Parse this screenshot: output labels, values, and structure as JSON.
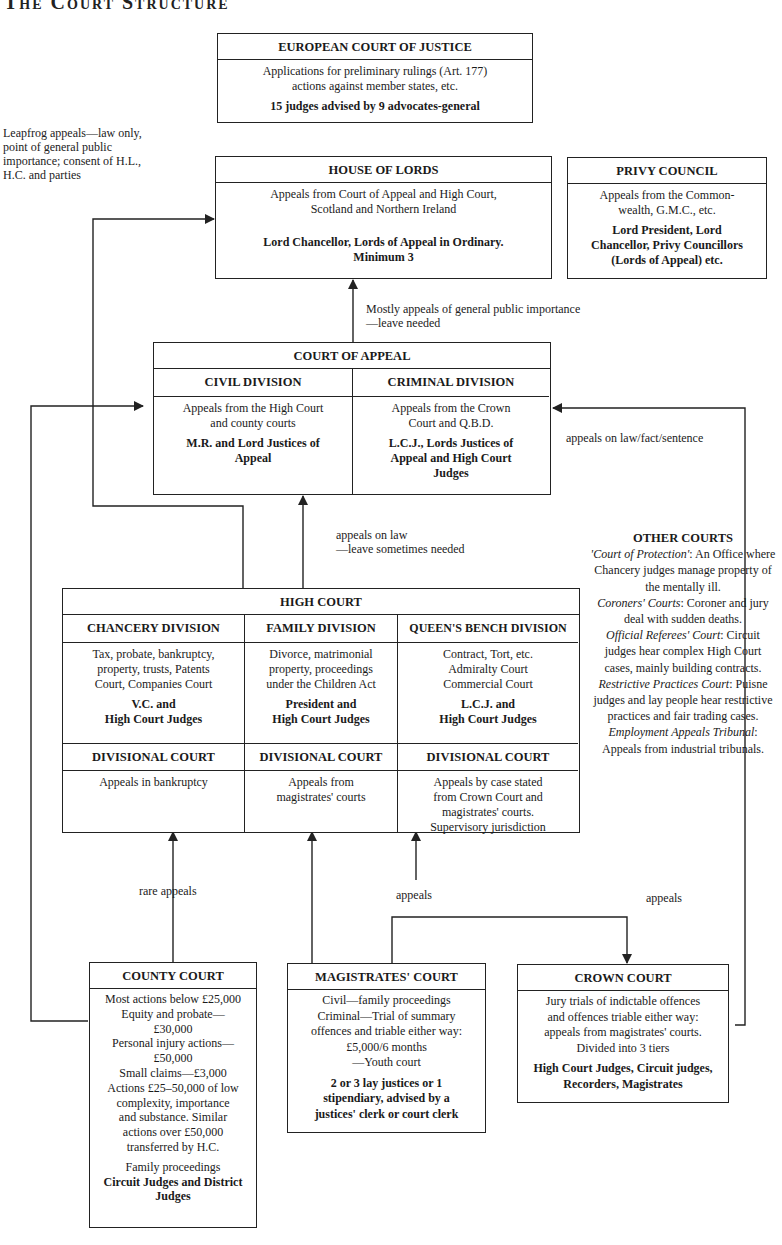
{
  "page": {
    "title": "The Court Structure"
  },
  "ecj": {
    "title": "EUROPEAN COURT OF JUSTICE",
    "line1": "Applications for preliminary rulings (Art. 177)",
    "line2": "actions against member states, etc.",
    "judges": "15 judges advised by 9 advocates-general"
  },
  "leapfrog": {
    "line1": "Leapfrog appeals—law only,",
    "line2": "point of general public",
    "line3": "importance; consent of H.L.,",
    "line4": "H.C. and parties"
  },
  "house_of_lords": {
    "title": "HOUSE OF LORDS",
    "line1": "Appeals from Court of Appeal and High Court,",
    "line2": "Scotland and Northern Ireland",
    "judges1": "Lord Chancellor, Lords of Appeal in Ordinary.",
    "judges2": "Minimum 3"
  },
  "privy_council": {
    "title": "PRIVY COUNCIL",
    "line1": "Appeals from the Common-",
    "line2": "wealth, G.M.C., etc.",
    "judges1": "Lord President, Lord",
    "judges2": "Chancellor, Privy Councillors",
    "judges3": "(Lords of Appeal) etc."
  },
  "hol_appeal_note": {
    "line1": "Mostly appeals of general public importance",
    "line2": "—leave needed"
  },
  "court_of_appeal": {
    "title": "COURT OF APPEAL",
    "civil": {
      "title": "CIVIL DIVISION",
      "line1": "Appeals from the High Court",
      "line2": "and county courts",
      "judges1": "M.R. and Lord Justices of",
      "judges2": "Appeal"
    },
    "criminal": {
      "title": "CRIMINAL DIVISION",
      "line1": "Appeals from the Crown",
      "line2": "Court and Q.B.D.",
      "judges1": "L.C.J., Lords Justices of",
      "judges2": "Appeal and High Court",
      "judges3": "Judges"
    }
  },
  "crown_to_ca_note": "appeals on law/fact/sentence",
  "hc_to_ca_note": {
    "line1": "appeals on law",
    "line2": "—leave sometimes needed"
  },
  "high_court": {
    "title": "HIGH COURT",
    "chancery": {
      "title": "CHANCERY DIVISION",
      "line1": "Tax, probate, bankruptcy,",
      "line2": "property, trusts, Patents",
      "line3": "Court, Companies Court",
      "judges1": "V.C. and",
      "judges2": "High Court Judges",
      "div_title": "DIVISIONAL COURT",
      "div_line1": "Appeals in bankruptcy"
    },
    "family": {
      "title": "FAMILY DIVISION",
      "line1": "Divorce, matrimonial",
      "line2": "property, proceedings",
      "line3": "under the Children Act",
      "judges1": "President and",
      "judges2": "High Court Judges",
      "div_title": "DIVISIONAL COURT",
      "div_line1": "Appeals from",
      "div_line2": "magistrates' courts"
    },
    "queens_bench": {
      "title": "QUEEN'S BENCH DIVISION",
      "line1": "Contract, Tort, etc.",
      "line2": "Admiralty Court",
      "line3": "Commercial Court",
      "judges1": "L.C.J. and",
      "judges2": "High Court Judges",
      "div_title": "DIVISIONAL COURT",
      "div_line1": "Appeals by case stated",
      "div_line2": "from Crown Court and",
      "div_line3": "magistrates' courts.",
      "div_line4": "Supervisory jurisdiction"
    }
  },
  "other_courts": {
    "title": "OTHER COURTS",
    "protection_name": "'Court of Protection'",
    "protection_text": ": An Office where Chancery judges manage property of the mentally ill.",
    "coroners_name": "Coroners' Courts",
    "coroners_text": ": Coroner and jury deal with sudden deaths.",
    "referees_name": "Official Referees' Court",
    "referees_text": ": Circuit judges hear complex High Court cases, mainly building contracts.",
    "restrictive_name": "Restrictive Practices Court",
    "restrictive_text": ": Puisne judges and lay people hear restrictive practices and fair trading cases.",
    "employment_name": "Employment Appeals Tribunal",
    "employment_text": ": Appeals from industrial tribunals."
  },
  "labels": {
    "rare_appeals": "rare appeals",
    "appeals_mid": "appeals",
    "appeals_right": "appeals"
  },
  "county_court": {
    "title": "COUNTY COURT",
    "line1": "Most actions below £25,000",
    "line2": "Equity and probate—",
    "line3": "£30,000",
    "line4": "Personal injury actions—",
    "line5": "£50,000",
    "line6": "Small claims—£3,000",
    "line7": "Actions £25–50,000 of low",
    "line8": "complexity, importance",
    "line9": "and substance. Similar",
    "line10": "actions over £50,000",
    "line11": "transferred by H.C.",
    "line12": "Family proceedings",
    "judges1": "Circuit Judges and District",
    "judges2": "Judges"
  },
  "magistrates_court": {
    "title": "MAGISTRATES' COURT",
    "line1": "Civil—family proceedings",
    "line2": "Criminal—Trial of summary",
    "line3": "offences and triable either way:",
    "line4": "£5,000/6 months",
    "line5": "—Youth court",
    "judges1": "2 or 3 lay justices or 1",
    "judges2": "stipendiary, advised by a",
    "judges3": "justices' clerk or court clerk"
  },
  "crown_court": {
    "title": "CROWN COURT",
    "line1": "Jury trials of indictable offences",
    "line2": "and offences triable either way:",
    "line3": "appeals from magistrates' courts.",
    "line4": "Divided into 3 tiers",
    "judges1": "High Court Judges, Circuit judges,",
    "judges2": "Recorders, Magistrates"
  },
  "colors": {
    "ink": "#222222",
    "paper": "#ffffff"
  }
}
